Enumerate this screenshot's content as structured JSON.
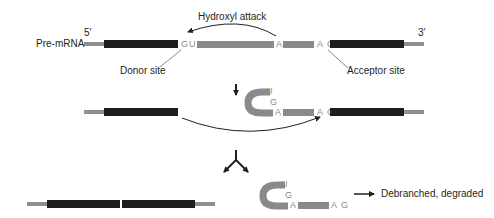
{
  "labels": {
    "pre_mrna": "Pre-mRNA",
    "five_prime": "5′",
    "three_prime": "3′",
    "hydroxyl_attack": "Hydroxyl attack",
    "donor_site": "Donor site",
    "acceptor_site": "Acceptor site",
    "debranched": "Debranched, degraded"
  },
  "nucleotides": {
    "donor_G": "G",
    "donor_U": "U",
    "branch_A": "A",
    "acceptor_AG": "A G",
    "lariat_U": "U",
    "lariat_G": "G",
    "lariat_A": "A",
    "lariat_AG": "A G",
    "final_U": "U",
    "final_G": "G",
    "final_A": "A",
    "final_AG": "A G"
  },
  "colors": {
    "exon": "#1e1e1e",
    "intron": "#8a8a8a",
    "utr": "#8f8f8f",
    "text": "#231f20",
    "arrow": "#231f20"
  }
}
